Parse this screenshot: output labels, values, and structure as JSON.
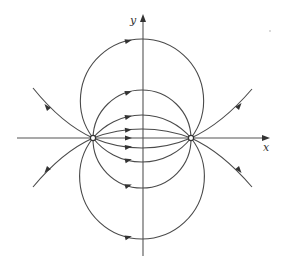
{
  "diagram": {
    "type": "phase-portrait",
    "axes": {
      "x_label": "x",
      "y_label": "y"
    },
    "nodes": [
      "left-node",
      "right-node"
    ],
    "upper_arcs": 4,
    "lower_arcs": 4,
    "outer_curves": 4,
    "arrow_direction": "left-to-right along arcs; outward on outer curves",
    "colors": {
      "line": "#4a4a4a",
      "background": "#ffffff"
    }
  }
}
